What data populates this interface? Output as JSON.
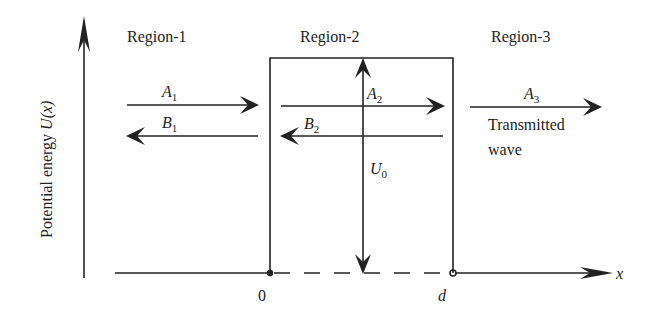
{
  "diagram": {
    "type": "potential barrier (quantum tunneling)",
    "y_axis_label": "Potential energy ",
    "y_axis_var": "U(x)",
    "x_axis_var": "x",
    "regions": [
      {
        "label": "Region-1"
      },
      {
        "label": "Region-2"
      },
      {
        "label": "Region-3"
      }
    ],
    "waves": {
      "A1": {
        "main": "A",
        "sub": "1",
        "direction": "right"
      },
      "B1": {
        "main": "B",
        "sub": "1",
        "direction": "left"
      },
      "A2": {
        "main": "A",
        "sub": "2",
        "direction": "right"
      },
      "B2": {
        "main": "B",
        "sub": "2",
        "direction": "left"
      },
      "A3": {
        "main": "A",
        "sub": "3",
        "direction": "right"
      }
    },
    "barrier_height": {
      "main": "U",
      "sub": "0"
    },
    "transmitted_line1": "Transmitted",
    "transmitted_line2": "wave",
    "x_ticks": {
      "start": "0",
      "end": "d"
    }
  }
}
